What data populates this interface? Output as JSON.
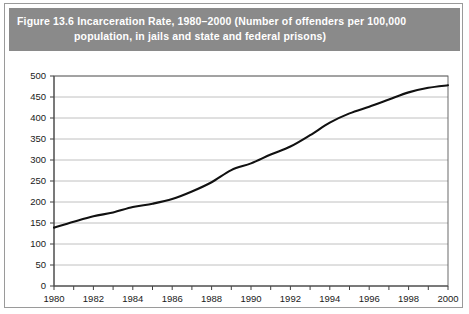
{
  "figure": {
    "caption_line_1": "Figure 13.6   Incarceration Rate, 1980–2000  (Number of offenders per 100,000",
    "caption_line_2": "population, in jails and state and federal prisons)"
  },
  "colors": {
    "header_background": "#8a8a8a",
    "header_text": "#ffffff",
    "gridline": "#b0b0b0",
    "data_line": "#111111",
    "axis": "#2b2b2b",
    "plot_background": "#ffffff",
    "frame_border": "#9a9a9a"
  },
  "chart_data": {
    "type": "line",
    "title": "Figure 13.6   Incarceration Rate, 1980–2000  (Number of offenders per 100,000 population, in jails and state and federal prisons)",
    "xlabel": "",
    "ylabel": "",
    "xlim": [
      1980,
      2000
    ],
    "ylim": [
      0,
      500
    ],
    "grid": true,
    "legend": false,
    "y_ticks": [
      0,
      50,
      100,
      150,
      200,
      250,
      300,
      350,
      400,
      450,
      500
    ],
    "y_tick_labels": [
      "0",
      "50",
      "100",
      "150",
      "200",
      "250",
      "300",
      "350",
      "400",
      "450",
      "500"
    ],
    "x_ticks": [
      1980,
      1981,
      1982,
      1983,
      1984,
      1985,
      1986,
      1987,
      1988,
      1989,
      1990,
      1991,
      1992,
      1993,
      1994,
      1995,
      1996,
      1997,
      1998,
      1999,
      2000
    ],
    "x_tick_labels_shown": [
      "1980",
      "1982",
      "1984",
      "1986",
      "1988",
      "1990",
      "1992",
      "1994",
      "1996",
      "1998",
      "2000"
    ],
    "x_label_interval": 2,
    "x": [
      1980,
      1981,
      1982,
      1983,
      1984,
      1985,
      1986,
      1987,
      1988,
      1989,
      1990,
      1991,
      1992,
      1993,
      1994,
      1995,
      1996,
      1997,
      1998,
      1999,
      2000
    ],
    "values": [
      139,
      153,
      166,
      175,
      188,
      196,
      207,
      225,
      247,
      276,
      292,
      313,
      332,
      359,
      389,
      411,
      427,
      444,
      461,
      472,
      478
    ],
    "series": [
      {
        "name": "Incarceration rate per 100,000 population",
        "values": [
          139,
          153,
          166,
          175,
          188,
          196,
          207,
          225,
          247,
          276,
          292,
          313,
          332,
          359,
          389,
          411,
          427,
          444,
          461,
          472,
          478
        ]
      }
    ]
  }
}
